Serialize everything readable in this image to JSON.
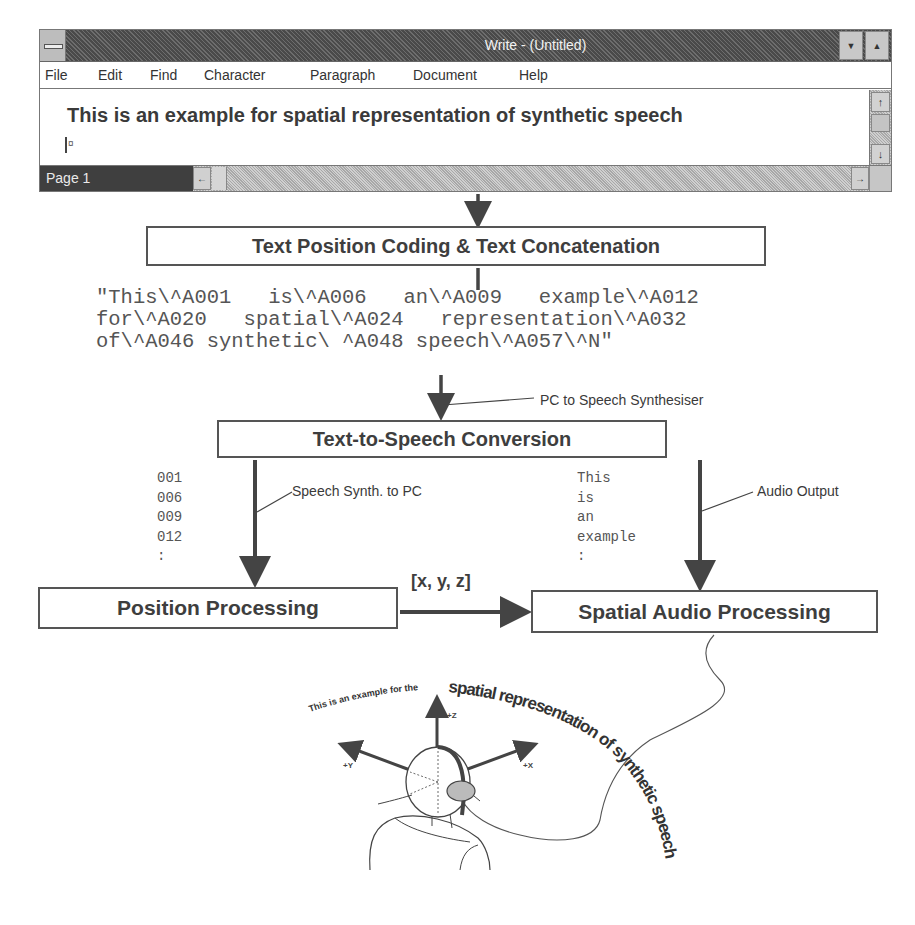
{
  "window": {
    "title": "Write - (Untitled)",
    "system_menu_icon": "system-menu-icon",
    "minimize_glyph": "▼",
    "maximize_glyph": "▲",
    "menu": [
      {
        "label": "File",
        "mnemonic": "F"
      },
      {
        "label": "Edit",
        "mnemonic": "E"
      },
      {
        "label": "Find",
        "mnemonic": "n"
      },
      {
        "label": "Character",
        "mnemonic": "C"
      },
      {
        "label": "Paragraph",
        "mnemonic": "P"
      },
      {
        "label": "Document",
        "mnemonic": "D"
      },
      {
        "label": "Help",
        "mnemonic": "H"
      }
    ],
    "document_text": "This is an example for spatial representation of synthetic speech",
    "caret_mark": "¤",
    "status": {
      "page": "Page 1"
    },
    "scroll": {
      "up": "↑",
      "down": "↓",
      "left": "←",
      "right": "→"
    }
  },
  "diagram": {
    "boxes": {
      "coding": "Text Position Coding & Text Concatenation",
      "tts": "Text-to-Speech Conversion",
      "position": "Position Processing",
      "spatial": "Spatial Audio Processing"
    },
    "coded_string": [
      "\"This\\^A001   is\\^A006   an\\^A009   example\\^A012",
      "for\\^A020   spatial\\^A024   representation\\^A032",
      "of\\^A046 synthetic\\ ^A048 speech\\^A057\\^N\""
    ],
    "position_values": [
      "001",
      "006",
      "009",
      "012",
      ":"
    ],
    "word_values": [
      "This",
      "is",
      "an",
      "example",
      ":"
    ],
    "labels": {
      "pc_to_synth": "PC to Speech Synthesiser",
      "synth_to_pc": "Speech Synth. to PC",
      "audio_output": "Audio Output",
      "coordinates": "[x, y, z]"
    },
    "illustration": {
      "arc_text_small": "This is an example for the",
      "arc_text_large": "spatial representation of synthetic speech",
      "axes": {
        "z": "+Z",
        "y": "+Y",
        "x": "+X"
      }
    }
  }
}
